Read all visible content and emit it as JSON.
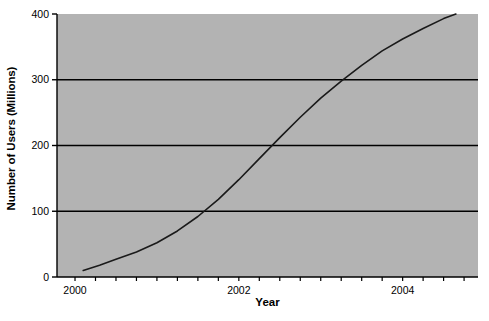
{
  "chart_data": {
    "type": "line",
    "title": "",
    "xlabel": "Year",
    "ylabel": "Number of Users (Millions)",
    "xlim": [
      1999.78,
      2004.92
    ],
    "ylim": [
      0,
      400
    ],
    "grid": true,
    "grid_axis": "y",
    "grid_values": [
      100,
      200,
      300
    ],
    "legend": "none",
    "plot_background": "#b3b3b3",
    "page_background": "#ffffff",
    "line_color": "#1a1a1a",
    "axis_color": "#000000",
    "x_ticks_labeled": [
      2000,
      2002,
      2004
    ],
    "x_tick_labels": [
      "2000",
      "2004",
      "2002"
    ],
    "x_minor_tick_step": 0.25,
    "y_ticks": [
      0,
      100,
      200,
      300,
      400
    ],
    "y_tick_labels": [
      "0",
      "100",
      "200",
      "300",
      "400"
    ],
    "series": [
      {
        "name": "Users",
        "x": [
          2000.1,
          2000.3,
          2000.5,
          2000.75,
          2001.0,
          2001.25,
          2001.5,
          2001.75,
          2002.0,
          2002.25,
          2002.5,
          2002.75,
          2003.0,
          2003.25,
          2003.5,
          2003.75,
          2004.0,
          2004.25,
          2004.5,
          2004.65
        ],
        "y": [
          10,
          18,
          27,
          38,
          52,
          70,
          92,
          118,
          148,
          180,
          212,
          243,
          272,
          298,
          322,
          344,
          362,
          378,
          393,
          400
        ]
      }
    ]
  },
  "axis_labels": {
    "x_title": "Year",
    "y_title": "Number of Users (Millions)"
  }
}
